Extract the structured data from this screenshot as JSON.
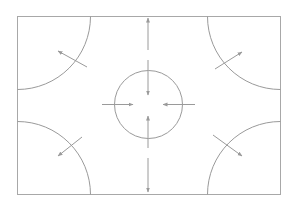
{
  "diagram": {
    "colors": {
      "background": "#ffffff",
      "stroke": "#9a9a9a",
      "frame": "#a8a8a8"
    },
    "frame": {
      "x": 17,
      "y": 16,
      "width": 263,
      "height": 178
    },
    "center_circle": {
      "cx": 148.5,
      "cy": 104.5,
      "r": 34
    },
    "corner_arcs": [
      {
        "id": "top-left",
        "r": 73
      },
      {
        "id": "top-right",
        "r": 73
      },
      {
        "id": "bottom-left",
        "r": 73
      },
      {
        "id": "bottom-right",
        "r": 73
      }
    ],
    "arrows": [
      {
        "id": "top-left-outward",
        "x1": 87,
        "y1": 67,
        "x2": 58,
        "y2": 51
      },
      {
        "id": "top-right-outward",
        "x1": 215,
        "y1": 69,
        "x2": 242,
        "y2": 52
      },
      {
        "id": "bottom-left-outward",
        "x1": 82,
        "y1": 137,
        "x2": 58,
        "y2": 156
      },
      {
        "id": "bottom-right-outward",
        "x1": 213,
        "y1": 135,
        "x2": 242,
        "y2": 156
      },
      {
        "id": "top-up",
        "x1": 148,
        "y1": 50,
        "x2": 148,
        "y2": 18
      },
      {
        "id": "top-down-into-circle",
        "x1": 148,
        "y1": 60,
        "x2": 148,
        "y2": 95
      },
      {
        "id": "bottom-up-into-circle",
        "x1": 148,
        "y1": 148,
        "x2": 148,
        "y2": 116
      },
      {
        "id": "bottom-down",
        "x1": 148,
        "y1": 158,
        "x2": 148,
        "y2": 192
      },
      {
        "id": "left-into-circle",
        "x1": 102,
        "y1": 104.5,
        "x2": 133,
        "y2": 104.5
      },
      {
        "id": "right-into-circle",
        "x1": 195,
        "y1": 104.5,
        "x2": 163,
        "y2": 104.5
      }
    ]
  }
}
